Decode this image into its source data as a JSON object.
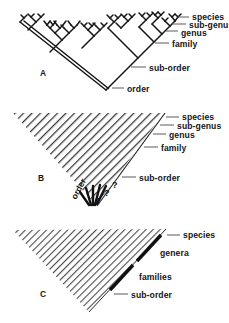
{
  "figure": {
    "background_color": "#ffffff",
    "line_color": "#161616",
    "hatch_color": "#555555"
  },
  "panels": [
    {
      "id": "A",
      "letter": "A",
      "type": "branching-tree",
      "labels": [
        {
          "key": "species",
          "text": "species"
        },
        {
          "key": "sub_genus",
          "text": "sub-genus"
        },
        {
          "key": "genus",
          "text": "genus"
        },
        {
          "key": "family",
          "text": "family"
        },
        {
          "key": "sub_order",
          "text": "sub-order"
        },
        {
          "key": "order",
          "text": "order"
        }
      ]
    },
    {
      "id": "B",
      "letter": "B",
      "type": "hatched-triangle-with-queries",
      "labels": [
        {
          "key": "species",
          "text": "species"
        },
        {
          "key": "sub_genus",
          "text": "sub-genus"
        },
        {
          "key": "genus",
          "text": "genus"
        },
        {
          "key": "family",
          "text": "family"
        },
        {
          "key": "sub_order",
          "text": "sub-order"
        },
        {
          "key": "order",
          "text": "order"
        }
      ],
      "query_marks": [
        "?",
        "?",
        "?"
      ]
    },
    {
      "id": "C",
      "letter": "C",
      "type": "hatched-triangle-with-bars",
      "labels": [
        {
          "key": "species",
          "text": "species"
        },
        {
          "key": "genera",
          "text": "genera"
        },
        {
          "key": "families",
          "text": "families"
        },
        {
          "key": "sub_order",
          "text": "sub-order"
        }
      ]
    }
  ]
}
